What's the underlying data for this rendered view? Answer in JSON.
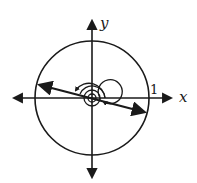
{
  "diagram": {
    "type": "unit-circle-rotation",
    "axes": {
      "x_label": "x",
      "y_label": "y"
    },
    "circle": {
      "radius_label": "1"
    },
    "rotation": {
      "description": "multiple counterclockwise rotations shown by concentric spiral arcs with arrows"
    },
    "colors": {
      "stroke": "#1a1a1a",
      "background": "#ffffff"
    }
  }
}
